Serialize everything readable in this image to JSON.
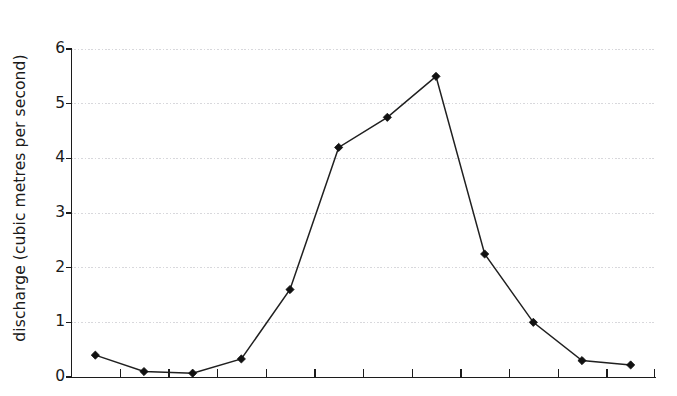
{
  "chart_data": {
    "type": "line",
    "title": "",
    "subtitle": "",
    "xlabel": "",
    "ylabel": "discharge (cubic metres per second)",
    "x": [
      1,
      2,
      3,
      4,
      5,
      6,
      7,
      8,
      9,
      10,
      11,
      12
    ],
    "values": [
      0.4,
      0.1,
      0.07,
      0.33,
      1.6,
      4.2,
      4.75,
      5.5,
      2.25,
      1.0,
      0.3,
      0.22
    ],
    "series": [
      {
        "name": "discharge",
        "values": [
          0.4,
          0.1,
          0.07,
          0.33,
          1.6,
          4.2,
          4.75,
          5.5,
          2.25,
          1.0,
          0.3,
          0.22
        ]
      }
    ],
    "ylim": [
      0,
      6
    ],
    "yticks": [
      0,
      1,
      2,
      3,
      4,
      5,
      6
    ],
    "ytick_labels": [
      "0",
      "1",
      "2",
      "3",
      "4",
      "5",
      "6"
    ],
    "xtick_labels": [],
    "xtick_count": 12,
    "grid": "horizontal-dotted",
    "legend": "none",
    "marker": "diamond",
    "line_color": "#202020",
    "marker_color": "#111111",
    "grid_color": "#d8d8dc",
    "axis_color": "#1c1c1c",
    "background": "#ffffff",
    "annotations": []
  },
  "axis": {
    "y_title": "discharge (cubic metres per second)",
    "y_labels": [
      "6",
      "5",
      "4",
      "3",
      "2",
      "1",
      "0"
    ]
  }
}
